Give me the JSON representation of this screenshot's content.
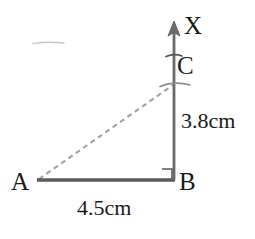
{
  "figure": {
    "colors": {
      "solid_line": "#5a5a5a",
      "dashed_line": "#a2a2a2",
      "text": "#1a1a1a",
      "background": "#ffffff",
      "artifact": "#c9c9c9"
    },
    "labels": {
      "ray_tip": "X",
      "point_c": "C",
      "point_a": "A",
      "point_b": "B",
      "vertical_measure": "3.8cm",
      "base_measure": "4.5cm"
    },
    "geometry": {
      "points": {
        "A": {
          "x": 38,
          "y": 180
        },
        "B": {
          "x": 174,
          "y": 180
        },
        "C": {
          "x": 174,
          "y": 84
        },
        "X_tip": {
          "x": 174,
          "y": 22
        }
      },
      "segments": [
        {
          "name": "base-AB",
          "from": "A",
          "to": "B",
          "style": "solid"
        },
        {
          "name": "vertical-BX",
          "from": "B",
          "to": "X_tip",
          "style": "solid-with-arrow"
        },
        {
          "name": "hypotenuse-AC",
          "from": "A",
          "to": "C",
          "style": "dashed"
        }
      ],
      "right_angle_at": "B",
      "arc_marks": [
        {
          "name": "arc-upper",
          "cx": 174,
          "cy": 55
        },
        {
          "name": "arc-at-c",
          "cx": 174,
          "cy": 84
        }
      ]
    }
  }
}
